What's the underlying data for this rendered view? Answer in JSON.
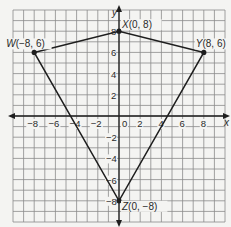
{
  "figure": {
    "type": "coordinate-plane-kite",
    "axes": {
      "x_label": "x",
      "y_label": "y"
    },
    "x_ticks": [
      "-8",
      "-6",
      "-4",
      "-2",
      "0",
      "2",
      "4",
      "6",
      "8"
    ],
    "y_ticks": [
      "8",
      "6",
      "4",
      "2",
      "-2",
      "-4",
      "-6",
      "-8"
    ],
    "grid_range": {
      "min": -10,
      "max": 10
    },
    "vertices": [
      {
        "name": "W",
        "label": "W(−8, 6)",
        "x": -8,
        "y": 6
      },
      {
        "name": "X",
        "label": "X(0, 8)",
        "x": 0,
        "y": 8
      },
      {
        "name": "Y",
        "label": "Y(8, 6)",
        "x": 8,
        "y": 6
      },
      {
        "name": "Z",
        "label": "Z(0, −8)",
        "x": 0,
        "y": -8
      }
    ],
    "colors": {
      "grid": "#8a8a8a",
      "axis": "#1e1e1e",
      "shape": "#1e1e1e",
      "background": "#f4f4f2"
    }
  }
}
